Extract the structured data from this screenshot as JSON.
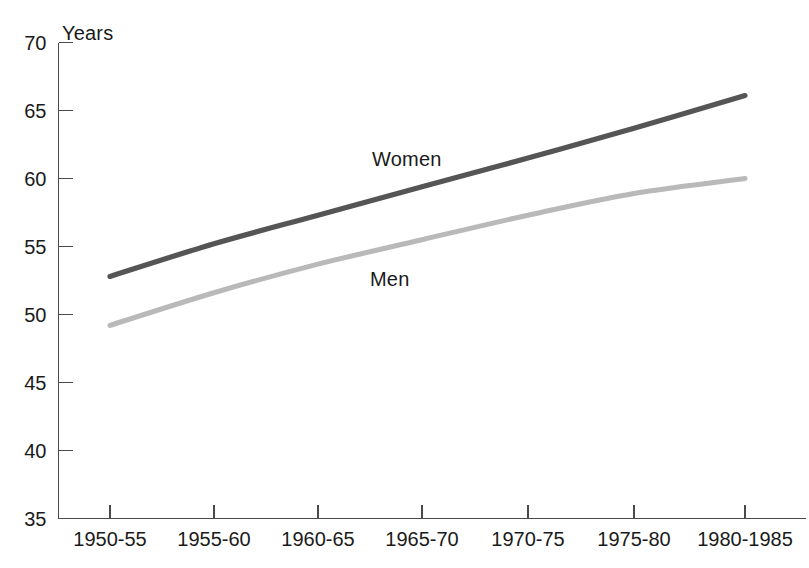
{
  "chart_data": {
    "type": "line",
    "title": "",
    "xlabel": "",
    "ylabel": "Years",
    "ylim": [
      35,
      70
    ],
    "yticks": [
      35,
      40,
      45,
      50,
      55,
      60,
      65,
      70
    ],
    "ytick_labels": [
      "35",
      "40",
      "45",
      "50",
      "55",
      "60",
      "65",
      "70"
    ],
    "grid": false,
    "legend_position": "inline-annotation",
    "categories": [
      "1950-55",
      "1955-60",
      "1960-65",
      "1965-70",
      "1970-75",
      "1975-80",
      "1980-1985"
    ],
    "series": [
      {
        "name": "Women",
        "color": "#555555",
        "values": [
          52.8,
          55.2,
          57.3,
          59.4,
          61.5,
          63.7,
          66.1
        ]
      },
      {
        "name": "Men",
        "color": "#b9b9b9",
        "values": [
          49.2,
          51.6,
          53.7,
          55.5,
          57.3,
          58.9,
          60.0
        ]
      }
    ],
    "annotations": [
      {
        "text": "Women",
        "x_frac": 0.455,
        "y_value": 61.5
      },
      {
        "text": "Men",
        "x_frac": 0.455,
        "y_value": 53.4
      }
    ]
  },
  "axes": {
    "y_unit_label": "Years"
  },
  "colors": {
    "axis": "#4a4a4a",
    "women_line": "#555555",
    "men_line": "#b9b9b9",
    "text": "#1a1a1a",
    "background": "#ffffff"
  }
}
